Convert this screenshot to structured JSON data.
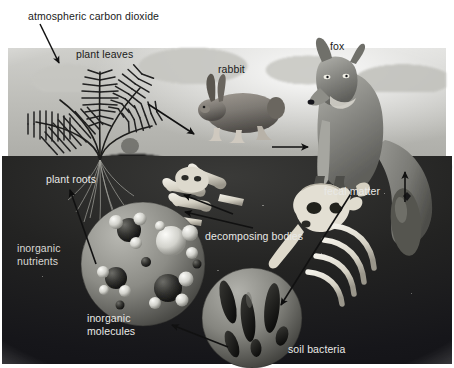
{
  "figure": {
    "palette": {
      "page_bg": "#ffffff",
      "sky": "#bdbdb8",
      "soil": "#232322",
      "arrow": "#111111",
      "label_dark": "#1a1a1a",
      "label_light": "#e9e9e6",
      "fox": "#8d8d88",
      "rabbit": "#7e7a74",
      "molecule_sphere": "#8f8f8a",
      "bone": "#e6e2d8"
    },
    "labels": [
      {
        "id": "atmospheric-carbon-dioxide",
        "text": "atmospheric carbon dioxide",
        "x": 28,
        "y": 10,
        "tone": "dark",
        "align": "left"
      },
      {
        "id": "plant-leaves",
        "text": "plant leaves",
        "x": 76,
        "y": 48,
        "tone": "dark",
        "align": "left"
      },
      {
        "id": "rabbit",
        "text": "rabbit",
        "x": 218,
        "y": 63,
        "tone": "dark",
        "align": "left"
      },
      {
        "id": "fox",
        "text": "fox",
        "x": 330,
        "y": 40,
        "tone": "dark",
        "align": "left"
      },
      {
        "id": "plant-roots",
        "text": "plant roots",
        "x": 46,
        "y": 173,
        "tone": "light",
        "align": "left"
      },
      {
        "id": "fecal-matter",
        "text": "fecal matter",
        "x": 324,
        "y": 185,
        "tone": "light",
        "align": "left"
      },
      {
        "id": "decomposing-bodies",
        "text": "decomposing bodies",
        "x": 205,
        "y": 230,
        "tone": "light",
        "align": "left"
      },
      {
        "id": "inorganic-nutrients",
        "text": "inorganic\nnutrients",
        "x": 17,
        "y": 242,
        "tone": "light",
        "align": "left"
      },
      {
        "id": "inorganic-molecules",
        "text": "inorganic\nmolecules",
        "x": 87,
        "y": 312,
        "tone": "light",
        "align": "left"
      },
      {
        "id": "soil-bacteria",
        "text": "soil bacteria",
        "x": 288,
        "y": 343,
        "tone": "light",
        "align": "left"
      }
    ],
    "arrows": [
      {
        "id": "arrow-co2-to-leaves",
        "from": "atmospheric carbon dioxide",
        "to": "plant leaves",
        "x1": 40,
        "y1": 24,
        "x2": 59,
        "y2": 63,
        "tone": "dark"
      },
      {
        "id": "arrow-leaves-to-rabbit",
        "from": "plant leaves",
        "to": "rabbit",
        "x1": 148,
        "y1": 104,
        "x2": 194,
        "y2": 134,
        "tone": "dark"
      },
      {
        "id": "arrow-rabbit-to-fox",
        "from": "rabbit",
        "to": "fox",
        "x1": 272,
        "y1": 147,
        "x2": 308,
        "y2": 147,
        "tone": "dark"
      },
      {
        "id": "arrow-fox-to-fecal-matter",
        "from": "fox",
        "to": "fecal matter",
        "x1": 405,
        "y1": 200,
        "x2": 405,
        "y2": 170,
        "tone": "dark"
      },
      {
        "id": "arrow-to-decomposing-left",
        "from": "fecal matter",
        "to": "decomposing bodies",
        "x1": 233,
        "y1": 215,
        "x2": 184,
        "y2": 195,
        "tone": "light"
      },
      {
        "id": "arrow-to-decomposing-mid",
        "from": "fecal matter",
        "to": "decomposing bodies",
        "x1": 253,
        "y1": 228,
        "x2": 185,
        "y2": 212,
        "tone": "light"
      },
      {
        "id": "arrow-fecal-to-bacteria",
        "from": "fecal matter",
        "to": "soil bacteria",
        "x1": 352,
        "y1": 192,
        "x2": 281,
        "y2": 305,
        "tone": "light"
      },
      {
        "id": "arrow-bacteria-to-molecules",
        "from": "soil bacteria",
        "to": "inorganic molecules",
        "x1": 228,
        "y1": 346,
        "x2": 172,
        "y2": 325,
        "tone": "dark"
      },
      {
        "id": "arrow-nutrients-to-roots",
        "from": "inorganic nutrients",
        "to": "plant roots",
        "x1": 96,
        "y1": 264,
        "x2": 70,
        "y2": 190,
        "tone": "light"
      }
    ],
    "organisms": [
      {
        "id": "fern-plant",
        "name": "fern plant with leaves and roots"
      },
      {
        "id": "rabbit-animal",
        "name": "rabbit"
      },
      {
        "id": "fox-animal",
        "name": "fox"
      },
      {
        "id": "skull-bones",
        "name": "decomposing bodies: skull, ribs and bones"
      },
      {
        "id": "molecule-cluster",
        "name": "inorganic molecules sphere"
      },
      {
        "id": "bacteria-cluster",
        "name": "soil bacteria sphere"
      },
      {
        "id": "fecal-pellet",
        "name": "fecal matter pellet"
      }
    ]
  }
}
